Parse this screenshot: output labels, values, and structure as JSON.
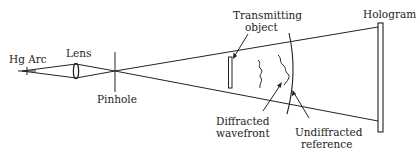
{
  "diagram": {
    "type": "optical-setup",
    "labels": {
      "hg_arc": "Hg Arc",
      "lens": "Lens",
      "pinhole": "Pinhole",
      "transmitting_object_line1": "Transmitting",
      "transmitting_object_line2": "object",
      "hologram": "Hologram",
      "diffracted_line1": "Diffracted",
      "diffracted_line2": "wavefront",
      "undiffracted_line1": "Undiffracted",
      "undiffracted_line2": "reference"
    },
    "components": [
      {
        "id": "hg-arc",
        "label": "Hg Arc",
        "kind": "light-source"
      },
      {
        "id": "lens",
        "label": "Lens",
        "kind": "lens"
      },
      {
        "id": "pinhole",
        "label": "Pinhole",
        "kind": "aperture"
      },
      {
        "id": "transmitting-object",
        "label": "Transmitting object",
        "kind": "object"
      },
      {
        "id": "diffracted-wavefront",
        "label": "Diffracted wavefront",
        "kind": "wavefront"
      },
      {
        "id": "undiffracted-reference",
        "label": "Undiffracted reference",
        "kind": "wavefront"
      },
      {
        "id": "hologram",
        "label": "Hologram",
        "kind": "recording-plate"
      }
    ],
    "colors": {
      "stroke": "#222222",
      "background": "#ffffff"
    }
  }
}
